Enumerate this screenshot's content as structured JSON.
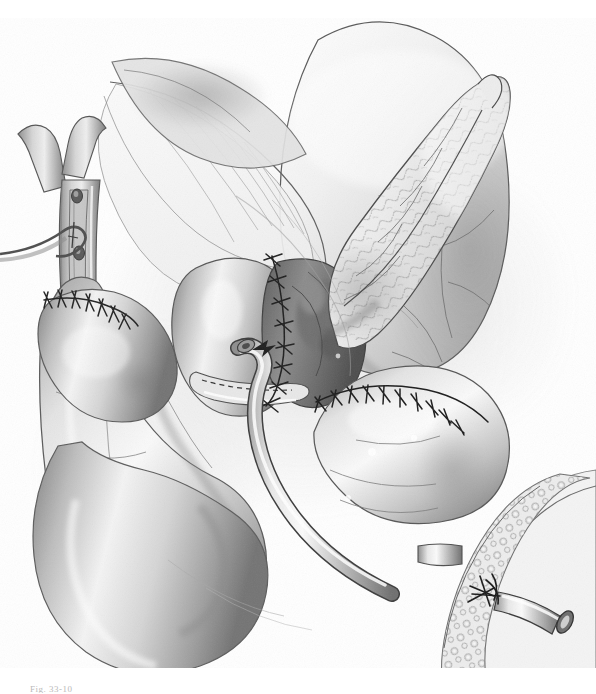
{
  "figure": {
    "domain": "medical-surgical-illustration",
    "medium": "graphite pencil drawing, monochrome grayscale on white",
    "caption": "Fig. 33-10",
    "caption_visible": "partially cropped at bottom edge",
    "background_color": "#ffffff",
    "ink_color": "#2b2b2b",
    "midtone_color": "#9a9a9a",
    "light_shade": "#d8d8d8",
    "highlight_color": "#ffffff",
    "width": 596,
    "height": 694
  },
  "anatomy": [
    {
      "id": "stomach",
      "label": "Stomach",
      "position": "upper right",
      "note": "large rounded viscus with serosal vessel markings, dome at top"
    },
    {
      "id": "pancreas",
      "label": "Pancreas body and tail",
      "position": "center right, oblique",
      "note": "lobulated glandular texture, tapering tail pointing upper right"
    },
    {
      "id": "hepatic-duct",
      "label": "Common hepatic duct with bifurcation",
      "position": "upper left",
      "note": "Y-shaped duct, opened longitudinally (ductotomy), two visible orifices"
    },
    {
      "id": "cystic-duct-stump",
      "label": "Cystic duct stump",
      "position": "left, crossing the hepatic duct",
      "note": "small hooked duct with ligature"
    },
    {
      "id": "jejunal-limb-roux",
      "label": "Roux-en-Y jejunal limb",
      "position": "left and lower centre",
      "note": "tubular bowel loop running down-left"
    },
    {
      "id": "jejunum-distal",
      "label": "Distal jejunum",
      "position": "lower right",
      "note": "bowel segment carrying the stent exit site"
    },
    {
      "id": "mesentery",
      "label": "Mesentery",
      "position": "upper centre-left",
      "note": "translucent fan with radiating vessels"
    },
    {
      "id": "duodenum-remnant",
      "label": "Bowel segment",
      "position": "centre right",
      "note": "rounded segment joined by transverse suture line"
    }
  ],
  "surgical_features": [
    {
      "id": "hepaticojejunostomy",
      "label": "Hepaticojejunostomy suture line",
      "type": "interrupted-sutures",
      "position": "upper left, transverse",
      "stitch_count": 7
    },
    {
      "id": "pancreaticojejunostomy",
      "label": "Pancreaticojejunostomy suture line",
      "type": "interrupted-sutures",
      "position": "centre, vertical",
      "stitch_count": 11
    },
    {
      "id": "enteroenterostomy",
      "label": "Enteroenterostomy suture line",
      "type": "interrupted-sutures",
      "position": "centre right, arched transverse",
      "stitch_count": 12
    },
    {
      "id": "purse-string",
      "label": "Purse-string suture at tube exit",
      "type": "purse-string",
      "position": "lower right"
    },
    {
      "id": "staple-line",
      "label": "Cut / staple line of divided duct",
      "type": "dashed-line",
      "position": "centre, below pancreatic anastomosis"
    }
  ],
  "devices": [
    {
      "id": "transanastomotic-stent",
      "label": "Transanastomotic stent tube",
      "note": "curved tube emerging from the anastomosis, sweeping down and right"
    },
    {
      "id": "drain-tube",
      "label": "Exteriorised drainage catheter",
      "note": "open-ended tube exiting bowel wall at lower right with bevelled lumen"
    }
  ]
}
